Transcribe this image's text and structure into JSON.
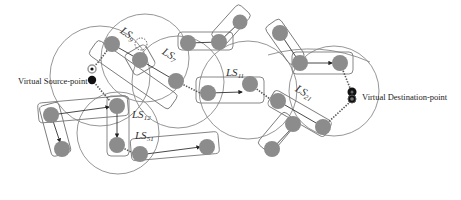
{
  "diagram": {
    "title": "",
    "labels": {
      "source": "Virtual Source-point",
      "destination": "Virtual Destination-point"
    },
    "ls_labels": [
      {
        "id": "LS9",
        "prefix": "LS",
        "sub": "9"
      },
      {
        "id": "LS7",
        "prefix": "LS",
        "sub": "7"
      },
      {
        "id": "LS11",
        "prefix": "LS",
        "sub": "11"
      },
      {
        "id": "LS21",
        "prefix": "LS",
        "sub": "21"
      },
      {
        "id": "LS12",
        "prefix": "LS",
        "sub": "12"
      },
      {
        "id": "LS51",
        "prefix": "LS",
        "sub": "51"
      }
    ],
    "colors": {
      "node_fill": "#8c8c8c",
      "range_stroke": "#8a8a8a",
      "group_stroke": "#7a7a7a",
      "edge": "#333333",
      "virtual_point": "#111111"
    }
  }
}
